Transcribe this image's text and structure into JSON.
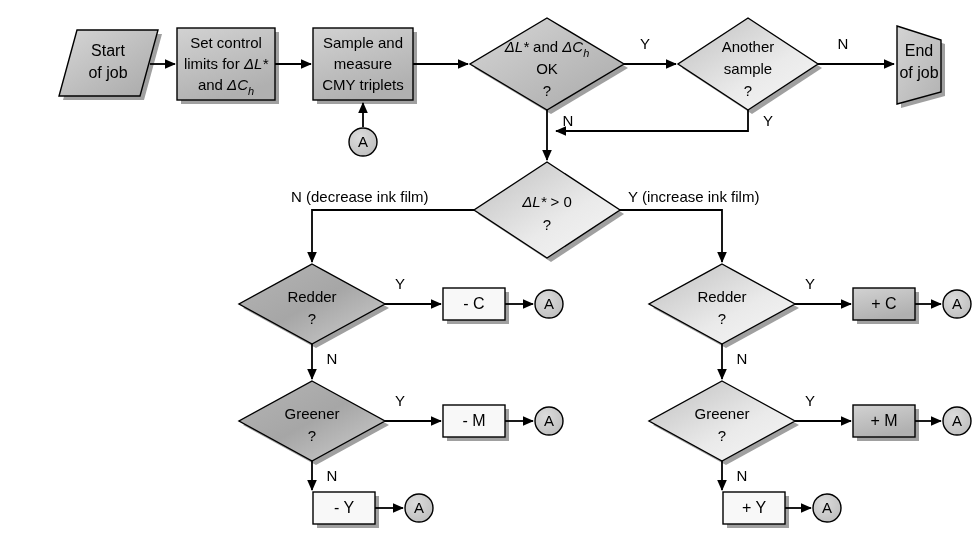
{
  "diagram": {
    "colors": {
      "shape_fill_mid": "#c0c0c0",
      "shape_fill_light": "#e8e8e8",
      "shape_fill_white": "#f7f7f7",
      "shape_fill_dark": "#b4b4b4",
      "connector_fill": "#c4c4c4",
      "stroke": "#000000",
      "text": "#000000"
    },
    "nodes": {
      "start": {
        "label_line1": "Start",
        "label_line2": "of job",
        "shape": "parallelogram"
      },
      "set_limits": {
        "label_line1": "Set control",
        "label_line2_pre": "limits for ",
        "label_line2_math": "ΔL*",
        "label_line3_pre": "and ",
        "label_line3_math": "ΔC",
        "label_line3_sub": "h",
        "shape": "process"
      },
      "sample": {
        "label_line1": "Sample and",
        "label_line2": "measure",
        "label_line3": "CMY triplets",
        "shape": "process"
      },
      "limits_ok": {
        "label_line1_a": "ΔL*",
        "label_line1_b": " and ",
        "label_line1_c": "ΔC",
        "label_line1_sub": "h",
        "label_line2": "OK",
        "label_line3": "?",
        "shape": "decision"
      },
      "another_sample": {
        "label_line1": "Another",
        "label_line2": "sample",
        "label_line3": "?",
        "shape": "decision"
      },
      "end": {
        "label_line1": "End",
        "label_line2": "of job",
        "shape": "terminator"
      },
      "delta_l_gt_zero": {
        "label_line1_math": "ΔL*",
        "label_line1_op": "> 0",
        "label_line2": "?",
        "shape": "decision"
      },
      "redder_left": {
        "label_line1": "Redder",
        "label_line2": "?",
        "shape": "decision"
      },
      "greener_left": {
        "label_line1": "Greener",
        "label_line2": "?",
        "shape": "decision"
      },
      "redder_right": {
        "label_line1": "Redder",
        "label_line2": "?",
        "shape": "decision"
      },
      "greener_right": {
        "label_line1": "Greener",
        "label_line2": "?",
        "shape": "decision"
      },
      "minus_c": {
        "label": "- C",
        "shape": "process"
      },
      "minus_m": {
        "label": "- M",
        "shape": "process"
      },
      "minus_y": {
        "label": "- Y",
        "shape": "process"
      },
      "plus_c": {
        "label": "+ C",
        "shape": "process"
      },
      "plus_m": {
        "label": "+ M",
        "shape": "process"
      },
      "plus_y": {
        "label": "+ Y",
        "shape": "process"
      }
    },
    "connectors": {
      "a_sample": {
        "label": "A"
      },
      "a_minus_c": {
        "label": "A"
      },
      "a_minus_m": {
        "label": "A"
      },
      "a_minus_y": {
        "label": "A"
      },
      "a_plus_c": {
        "label": "A"
      },
      "a_plus_m": {
        "label": "A"
      },
      "a_plus_y": {
        "label": "A"
      }
    },
    "edge_labels": {
      "limits_ok_yes": "Y",
      "limits_ok_no": "N",
      "another_sample_no": "N",
      "another_sample_yes": "Y",
      "delta_l_no": "N (decrease ink film)",
      "delta_l_yes": "Y (increase ink film)",
      "redder_left_yes": "Y",
      "redder_left_no": "N",
      "greener_left_yes": "Y",
      "greener_left_no": "N",
      "redder_right_yes": "Y",
      "redder_right_no": "N",
      "greener_right_yes": "Y",
      "greener_right_no": "N"
    }
  }
}
